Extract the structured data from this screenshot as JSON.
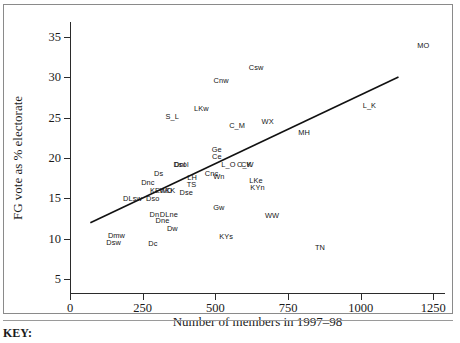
{
  "key_note": "KEY:",
  "chart_data": {
    "type": "scatter",
    "title": "",
    "xlabel": "Number of members in 1997–98",
    "ylabel": "FG vote as % electorate",
    "xlim": [
      0,
      1290
    ],
    "ylim": [
      3.2,
      36.8
    ],
    "xticks": [
      0,
      250,
      500,
      750,
      1000,
      1250
    ],
    "yticks": [
      5,
      10,
      15,
      20,
      25,
      30,
      35
    ],
    "grid": false,
    "legend": null,
    "point_style": "text-label-only",
    "points": [
      {
        "label": "MO",
        "x": 1215,
        "y": 34.0
      },
      {
        "label": "Csw",
        "x": 640,
        "y": 31.2
      },
      {
        "label": "Cnw",
        "x": 520,
        "y": 29.6
      },
      {
        "label": "LKw",
        "x": 452,
        "y": 26.2
      },
      {
        "label": "S_L",
        "x": 352,
        "y": 25.2
      },
      {
        "label": "C_M",
        "x": 575,
        "y": 24.1
      },
      {
        "label": "WX",
        "x": 680,
        "y": 24.6
      },
      {
        "label": "L_K",
        "x": 1030,
        "y": 26.5
      },
      {
        "label": "MH",
        "x": 805,
        "y": 23.2
      },
      {
        "label": "Ge",
        "x": 505,
        "y": 21.1
      },
      {
        "label": "Ce",
        "x": 505,
        "y": 20.2
      },
      {
        "label": "L_O",
        "x": 545,
        "y": 19.3
      },
      {
        "label": "Dnl",
        "x": 378,
        "y": 19.3
      },
      {
        "label": "Dsol",
        "x": 382,
        "y": 19.3
      },
      {
        "label": "C_K",
        "x": 600,
        "y": 19.2
      },
      {
        "label": "CW",
        "x": 610,
        "y": 19.2
      },
      {
        "label": "Cnc",
        "x": 487,
        "y": 18.2
      },
      {
        "label": "Wn",
        "x": 512,
        "y": 17.8
      },
      {
        "label": "Ds",
        "x": 305,
        "y": 18.2
      },
      {
        "label": "LH",
        "x": 420,
        "y": 17.6
      },
      {
        "label": "TS",
        "x": 418,
        "y": 16.8
      },
      {
        "label": "LKe",
        "x": 640,
        "y": 17.3
      },
      {
        "label": "KYn",
        "x": 645,
        "y": 16.4
      },
      {
        "label": "Dnc",
        "x": 268,
        "y": 17.0
      },
      {
        "label": "KEn",
        "x": 300,
        "y": 16.0
      },
      {
        "label": "WD",
        "x": 330,
        "y": 16.0
      },
      {
        "label": "KK",
        "x": 345,
        "y": 16.0
      },
      {
        "label": "Dse",
        "x": 400,
        "y": 15.8
      },
      {
        "label": "DLsw",
        "x": 215,
        "y": 15.1
      },
      {
        "label": "Dso",
        "x": 285,
        "y": 15.1
      },
      {
        "label": "Dn",
        "x": 290,
        "y": 13.1
      },
      {
        "label": "DLne",
        "x": 340,
        "y": 13.1
      },
      {
        "label": "Dne",
        "x": 318,
        "y": 12.3
      },
      {
        "label": "Gw",
        "x": 512,
        "y": 13.9
      },
      {
        "label": "WW",
        "x": 695,
        "y": 12.9
      },
      {
        "label": "Dw",
        "x": 352,
        "y": 11.4
      },
      {
        "label": "KYs",
        "x": 537,
        "y": 10.4
      },
      {
        "label": "Dmw",
        "x": 160,
        "y": 10.5
      },
      {
        "label": "Dsw",
        "x": 150,
        "y": 9.6
      },
      {
        "label": "Dc",
        "x": 285,
        "y": 9.5
      },
      {
        "label": "TN",
        "x": 860,
        "y": 9.0
      }
    ],
    "trend_line": {
      "type": "linear-fit",
      "x_start": 70,
      "y_start": 12.0,
      "x_end": 1130,
      "y_end": 30.0
    }
  }
}
